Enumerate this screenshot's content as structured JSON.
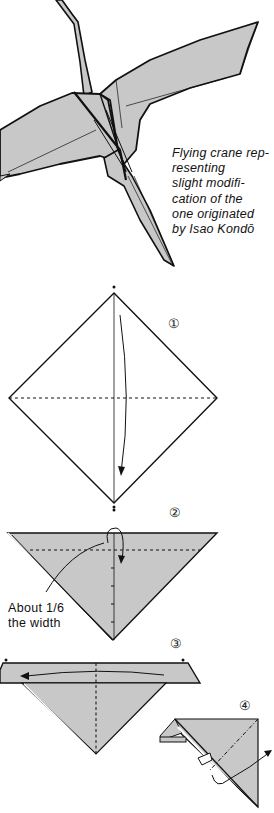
{
  "caption": {
    "lines": [
      "Flying crane rep-",
      "resenting",
      "slight modifi-",
      "cation of the",
      "one originated",
      "by Isao Kondō"
    ]
  },
  "annotations": {
    "step2_note_lines": [
      "About 1/6",
      "the width"
    ]
  },
  "steps": [
    {
      "number": "①",
      "description": "Square diamond with dashed horizontal valley fold, fold top corner down to bottom"
    },
    {
      "number": "②",
      "description": "Triangle, fold top edge down about 1/6 the width"
    },
    {
      "number": "③",
      "description": "Folded band, fold right over to left along dashed centre line"
    },
    {
      "number": "④",
      "description": "Side view, inside reverse fold with arrow"
    }
  ],
  "colors": {
    "paper_shade": "#c8c8c8",
    "line": "#111111",
    "background": "#ffffff"
  }
}
